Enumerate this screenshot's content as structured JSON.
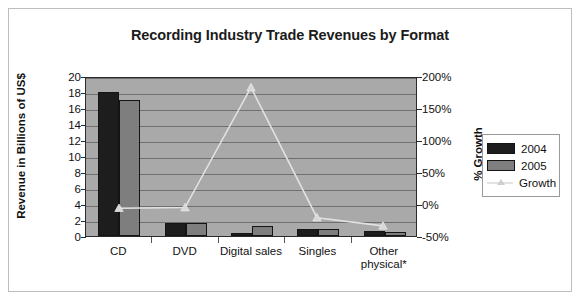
{
  "chart_data": {
    "type": "bar",
    "title": "Recording Industry Trade Revenues by Format",
    "categories": [
      "CD",
      "DVD",
      "Digital sales",
      "Singles",
      "Other physical*"
    ],
    "xlabel": "",
    "ylabel": "Revenue in Billions of US$",
    "ylabel_right": "% Growth",
    "ylim": [
      0,
      20
    ],
    "yticks": [
      0,
      2,
      4,
      6,
      8,
      10,
      12,
      14,
      16,
      18,
      20
    ],
    "ytick_labels": [
      "0",
      "2",
      "4",
      "6",
      "8",
      "10",
      "12",
      "14",
      "16",
      "18",
      "20"
    ],
    "ylim_right": [
      -50,
      200
    ],
    "yticks_right": [
      -50,
      0,
      50,
      100,
      150,
      200
    ],
    "ytick_labels_right": [
      "-50%",
      "0%",
      "50%",
      "100%",
      "150%",
      "200%"
    ],
    "grid": true,
    "legend_position": "right",
    "plot_background": "#a9a9a9",
    "series": [
      {
        "name": "2004",
        "type": "bar",
        "axis": "left",
        "color": "#1d1d1d",
        "values": [
          18.0,
          1.6,
          0.4,
          0.9,
          0.6
        ]
      },
      {
        "name": "2005",
        "type": "bar",
        "axis": "left",
        "color": "#7e7e7e",
        "values": [
          17.0,
          1.6,
          1.2,
          0.9,
          0.5
        ]
      },
      {
        "name": "Growth",
        "type": "line",
        "axis": "right",
        "color": "#e2e2e2",
        "marker": "triangle",
        "values": [
          -6,
          -5,
          185,
          -21,
          -34
        ],
        "value_labels": [
          "-6%",
          "-5%",
          "185%",
          "-21%",
          "-34%"
        ]
      }
    ]
  },
  "legend": {
    "items": [
      {
        "label": "2004",
        "swatch": "bar-dark"
      },
      {
        "label": "2005",
        "swatch": "bar-gray"
      },
      {
        "label": "Growth",
        "swatch": "line-triangle"
      }
    ]
  }
}
